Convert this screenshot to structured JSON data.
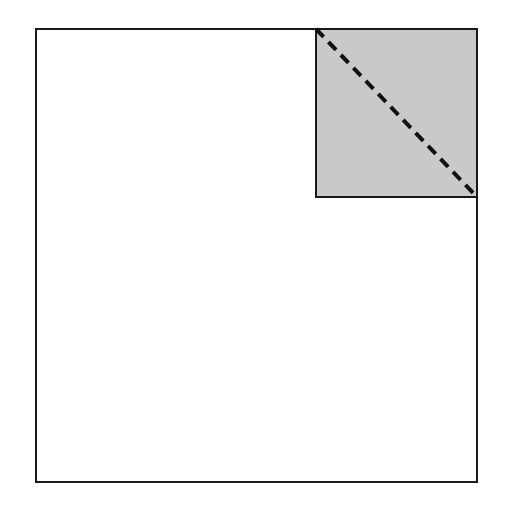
{
  "figure": {
    "background_color": "#ffffff",
    "stroke_color": "#1a1a1a",
    "shade_color": "#c9c9c9",
    "dash_color": "#111111",
    "outer_square": {
      "name": "outer-square",
      "x": 35,
      "y": 28,
      "width": 443,
      "height": 455,
      "fill": "#ffffff",
      "stroke": "#1a1a1a",
      "stroke_width": 2
    },
    "shaded_square": {
      "name": "shaded-corner-square",
      "x": 315,
      "y": 28,
      "width": 163,
      "height": 170,
      "fill": "#c9c9c9",
      "stroke": "#1a1a1a",
      "stroke_width": 2,
      "corner": "top-right"
    },
    "dashed_diagonal": {
      "name": "dashed-diagonal",
      "x1": 316,
      "y1": 29,
      "x2": 477,
      "y2": 197,
      "stroke": "#111111",
      "stroke_width": 4,
      "dash_length": 11,
      "gap_length": 7,
      "linecap": "butt"
    }
  }
}
